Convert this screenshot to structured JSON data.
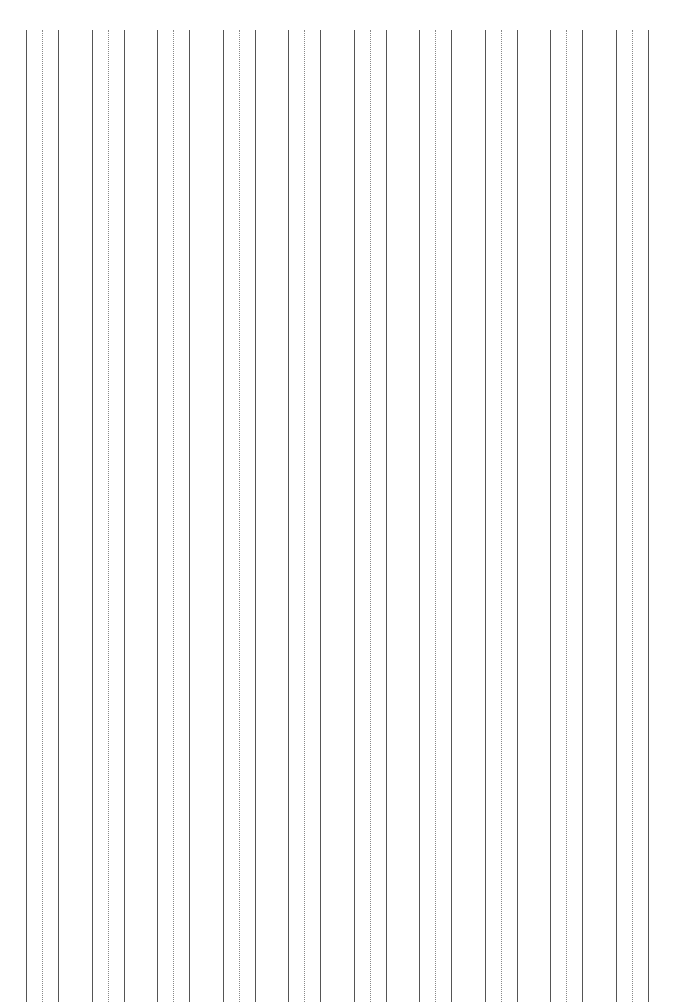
{
  "sheet": {
    "type": "vertical handwriting practice lines",
    "group_count": 10,
    "group_start_x": 26,
    "group_spacing": 65.5,
    "line_offsets": [
      0,
      16,
      32
    ],
    "line_styles": [
      "solid",
      "dotted",
      "solid"
    ],
    "line_top": 30,
    "colors": {
      "background": "#ffffff",
      "solid": "#555555",
      "dotted": "#888888"
    }
  }
}
